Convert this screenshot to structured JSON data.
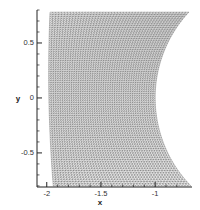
{
  "chart_data": {
    "type": "mesh",
    "title": "",
    "xlabel": "x",
    "ylabel": "y",
    "xlim": [
      -2.09,
      -0.66
    ],
    "ylim": [
      -0.81,
      0.8
    ],
    "xticks": [
      {
        "value": -2,
        "label": "-2"
      },
      {
        "value": -1.5,
        "label": "-1.5"
      },
      {
        "value": -1,
        "label": "-1"
      }
    ],
    "yticks": [
      {
        "value": 0.5,
        "label": "0.5"
      },
      {
        "value": 0,
        "label": "0"
      },
      {
        "value": -0.5,
        "label": "-0.5"
      }
    ],
    "minor_ticks": true,
    "grid": false,
    "legend": null,
    "mesh": {
      "description": "Structured curvilinear grid between a nearly straight left boundary and a concave circular-arc right boundary",
      "y_range": [
        -0.8,
        0.78
      ],
      "left_boundary": {
        "x_at_top": -1.97,
        "x_at_mid": -1.98,
        "x_at_bottom": -1.94
      },
      "right_boundary": {
        "shape": "circular-arc",
        "center": [
          0.135,
          0
        ],
        "radius": 1.135,
        "x_at_y0": -1.0,
        "x_at_y_max": -0.69
      },
      "i_lines": 48,
      "j_lines": 80,
      "line_color": "#555555"
    }
  },
  "axes": {
    "x_title": "x",
    "y_title": "y"
  }
}
